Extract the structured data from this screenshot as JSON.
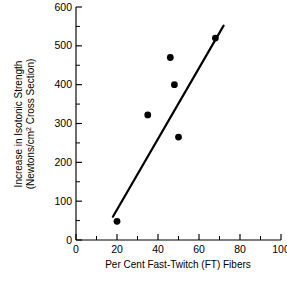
{
  "chart_data": {
    "type": "scatter",
    "title": "",
    "xlabel": "Per Cent Fast-Twitch (FT) Fibers",
    "ylabel_line1": "Increase in Isotonic Strength",
    "ylabel_line2_pre": "(Newtons/cm",
    "ylabel_line2_sup": "2",
    "ylabel_line2_post": " Cross Section)",
    "xlim": [
      0,
      100
    ],
    "ylim": [
      0,
      600
    ],
    "x_major_ticks": [
      0,
      20,
      40,
      60,
      80,
      100
    ],
    "x_minor_ticks": [
      10,
      30,
      50,
      70,
      90
    ],
    "y_major_ticks": [
      0,
      100,
      200,
      300,
      400,
      500,
      600
    ],
    "y_minor_ticks": [
      50,
      150,
      250,
      350,
      450,
      550
    ],
    "x_tick_labels": [
      "0",
      "20",
      "40",
      "60",
      "80",
      "100"
    ],
    "y_tick_labels": [
      "0",
      "100",
      "200",
      "300",
      "400",
      "500",
      "600"
    ],
    "grid": false,
    "legend": "none",
    "series": [
      {
        "name": "Subjects",
        "marker": "filled-circle",
        "color": "#000000",
        "points": [
          {
            "x": 20,
            "y": 48
          },
          {
            "x": 35,
            "y": 322
          },
          {
            "x": 46,
            "y": 470
          },
          {
            "x": 48,
            "y": 400
          },
          {
            "x": 50,
            "y": 265
          },
          {
            "x": 68,
            "y": 520
          }
        ]
      }
    ],
    "trendline": {
      "name": "regression-line",
      "color": "#000000",
      "x_start": 18,
      "y_start": 60,
      "x_end": 72,
      "y_end": 552
    }
  },
  "caption": {
    "fragment": ""
  },
  "colors": {
    "ink": "#000000",
    "background": "#ffffff"
  }
}
